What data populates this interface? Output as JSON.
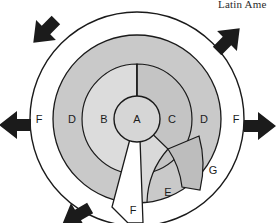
{
  "caption": {
    "text": "Latin Ame"
  },
  "diagram": {
    "type": "concentric-ring-model",
    "colors": {
      "core": "#d6d6d6",
      "inner_left": "#dcdcdc",
      "inner_right": "#c4c4c4",
      "middle": "#c9c9c9",
      "outer": "#ffffff",
      "sector_e": "#d9d9d9",
      "sector_g": "#bdbdbd",
      "stroke": "#1a1a1a",
      "arrow": "#1b1b1b",
      "background": "#ffffff"
    },
    "zones": [
      {
        "id": "A",
        "label": "A",
        "role": "core",
        "x": 137,
        "y": 119
      },
      {
        "id": "B",
        "label": "B",
        "role": "inner-left",
        "x": 104,
        "y": 119
      },
      {
        "id": "C",
        "label": "C",
        "role": "inner-right",
        "x": 172,
        "y": 119
      },
      {
        "id": "D_left",
        "label": "D",
        "role": "middle-left",
        "x": 72,
        "y": 119
      },
      {
        "id": "D_right",
        "label": "D",
        "role": "middle-right",
        "x": 204,
        "y": 119
      },
      {
        "id": "F_left",
        "label": "F",
        "role": "outer-left",
        "x": 39,
        "y": 119
      },
      {
        "id": "F_right",
        "label": "F",
        "role": "outer-right",
        "x": 236,
        "y": 119
      },
      {
        "id": "F_wedge",
        "label": "F",
        "role": "wedge-bottom",
        "x": 133,
        "y": 211
      },
      {
        "id": "E",
        "label": "E",
        "role": "sector-lower-right",
        "x": 168,
        "y": 193
      },
      {
        "id": "G",
        "label": "G",
        "role": "sector-right",
        "x": 213,
        "y": 171
      }
    ],
    "arrows": [
      {
        "id": "arrow-up-left",
        "direction": "up-left",
        "angle": 225
      },
      {
        "id": "arrow-up-right",
        "direction": "up-right",
        "angle": 315
      },
      {
        "id": "arrow-right",
        "direction": "right",
        "angle": 0
      },
      {
        "id": "arrow-left",
        "direction": "left",
        "angle": 180
      },
      {
        "id": "arrow-down-left",
        "direction": "down-left",
        "angle": 115
      }
    ]
  }
}
